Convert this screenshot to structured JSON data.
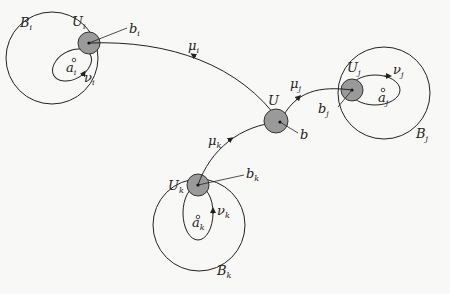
{
  "diagram": {
    "type": "graph-with-neighborhoods",
    "center_node": {
      "label": "U",
      "pointer_label": "b"
    },
    "nodes": [
      {
        "id": "i",
        "ball": "B",
        "ball_sub": "i",
        "nbhd": "U",
        "nbhd_sub": "i",
        "point": "a",
        "point_sub": "i",
        "loop": "ν",
        "loop_sub": "i",
        "base": "b",
        "base_sub": "i",
        "path": "μ",
        "path_sub": "i"
      },
      {
        "id": "j",
        "ball": "B",
        "ball_sub": "j",
        "nbhd": "U",
        "nbhd_sub": "j",
        "point": "a",
        "point_sub": "j",
        "loop": "ν",
        "loop_sub": "j",
        "base": "b",
        "base_sub": "j",
        "path": "μ",
        "path_sub": "j"
      },
      {
        "id": "k",
        "ball": "B",
        "ball_sub": "k",
        "nbhd": "U",
        "nbhd_sub": "k",
        "point": "a",
        "point_sub": "k",
        "loop": "ν",
        "loop_sub": "k",
        "base": "b",
        "base_sub": "k",
        "path": "μ",
        "path_sub": "k"
      }
    ],
    "colors": {
      "line": "#222222",
      "shade": "#9a9a9a",
      "background": "#f8f8f6"
    }
  }
}
